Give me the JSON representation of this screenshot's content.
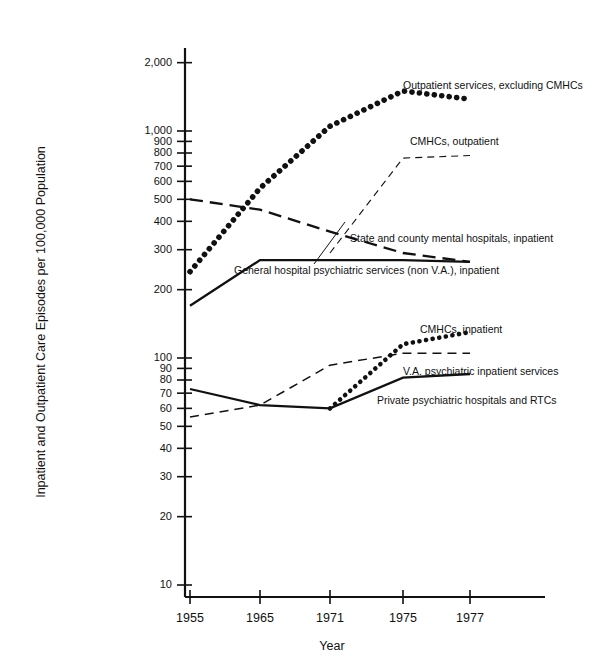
{
  "chart_data": {
    "type": "line",
    "title": "",
    "xlabel": "Year",
    "ylabel": "Inpatient and Outpatient Care Episodes per 100,000 Population",
    "scale": "log-y",
    "grid": false,
    "legend_position": "inline-annotations",
    "x": [
      1955,
      1965,
      1971,
      1975,
      1977
    ],
    "xtick_labels": [
      "1955",
      "1965",
      "1971",
      "1975",
      "1977"
    ],
    "ytick_labels": [
      "2,000",
      "1,000",
      "900",
      "800",
      "700",
      "600",
      "500",
      "400",
      "300",
      "200",
      "100",
      "90",
      "80",
      "70",
      "60",
      "50",
      "40",
      "30",
      "20",
      "10"
    ],
    "ytick_values": [
      2000,
      1000,
      900,
      800,
      700,
      600,
      500,
      400,
      300,
      200,
      100,
      90,
      80,
      70,
      60,
      50,
      40,
      30,
      20,
      10
    ],
    "ylim": [
      10,
      2600
    ],
    "series": [
      {
        "name": "Outpatient services, excluding CMHCs",
        "style": "dotted-thick",
        "values": [
          240,
          560,
          1050,
          1500,
          1380
        ]
      },
      {
        "name": "CMHCs, outpatient",
        "style": "dashed-thin",
        "values": [
          null,
          null,
          290,
          760,
          780
        ]
      },
      {
        "name": "State and county mental hospitals, inpatient",
        "style": "dashed-thick",
        "values": [
          500,
          450,
          360,
          290,
          265
        ]
      },
      {
        "name": "General hospital psychiatric services (non V.A.), inpatient",
        "style": "solid-thick",
        "values": [
          170,
          270,
          270,
          270,
          265
        ]
      },
      {
        "name": "CMHCs, inpatient",
        "style": "dotted-med",
        "values": [
          null,
          null,
          60,
          115,
          130
        ]
      },
      {
        "name": "V.A. psychiatric inpatient services",
        "style": "dashed-thin2",
        "values": [
          55,
          62,
          93,
          105,
          105
        ]
      },
      {
        "name": "Private psychiatric hospitals and RTCs",
        "style": "solid-thick",
        "values": [
          73,
          62,
          60,
          82,
          85
        ]
      }
    ],
    "annotations": [
      {
        "text": "Outpatient services, excluding CMHCs",
        "x": 403,
        "y": 86
      },
      {
        "text": "CMHCs, outpatient",
        "x": 410,
        "y": 142
      },
      {
        "text": "State and county mental hospitals, inpatient",
        "x": 350,
        "y": 239
      },
      {
        "text": "General hospital psychiatric services (non V.A.), inpatient",
        "x": 234,
        "y": 271
      },
      {
        "text": "CMHCs, inpatient",
        "x": 420,
        "y": 330
      },
      {
        "text": "V.A. psychiatric inpatient services",
        "x": 403,
        "y": 372
      },
      {
        "text": "Private psychiatric hospitals and RTCs",
        "x": 377,
        "y": 401
      }
    ]
  }
}
